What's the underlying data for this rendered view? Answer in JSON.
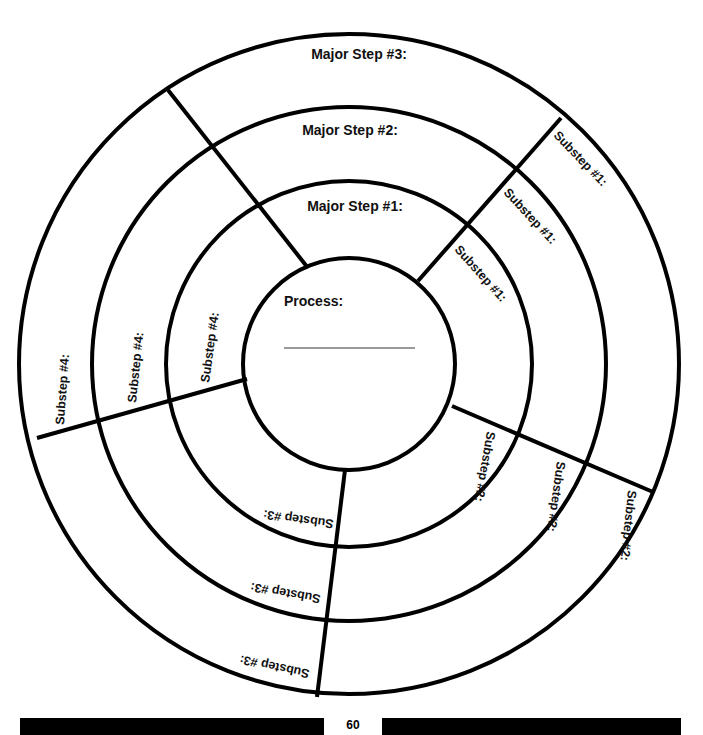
{
  "diagram": {
    "center": {
      "label": "Process:",
      "blank_line": true
    },
    "rings": [
      {
        "name": "Major Step #1:",
        "substeps": [
          "Substep #1:",
          "Substep #2:",
          "Substep #3:",
          "Substep #4:"
        ]
      },
      {
        "name": "Major Step #2:",
        "substeps": [
          "Substep #1:",
          "Substep #2:",
          "Substep #3:",
          "Substep #4:"
        ]
      },
      {
        "name": "Major Step #3:",
        "substeps": [
          "Substep #1:",
          "Substep #2:",
          "Substep #3:",
          "Substep #4:"
        ]
      }
    ],
    "colors": {
      "stroke": "#000000",
      "background": "#ffffff",
      "blank_line": "#777777"
    }
  },
  "footer": {
    "page_number": "60"
  }
}
